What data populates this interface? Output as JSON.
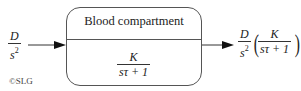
{
  "input": {
    "num": "D",
    "den": "s",
    "den_exp": "2"
  },
  "block": {
    "title": "Blood compartment",
    "tf_num": "K",
    "tf_den": "sτ + 1"
  },
  "output": {
    "prefix_num": "D",
    "prefix_den": "s",
    "prefix_exp": "2",
    "inner_num": "K",
    "inner_den": "sτ + 1"
  },
  "copyright": "©SLG",
  "colors": {
    "line": "#333333",
    "box_border": "#555555",
    "text": "#222222"
  }
}
